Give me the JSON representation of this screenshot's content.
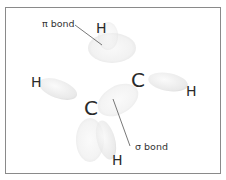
{
  "diagram": {
    "atoms": [
      {
        "id": "h-top",
        "symbol": "H"
      },
      {
        "id": "h-left",
        "symbol": "H"
      },
      {
        "id": "c-right",
        "symbol": "C"
      },
      {
        "id": "h-right",
        "symbol": "H"
      },
      {
        "id": "c-left",
        "symbol": "C"
      },
      {
        "id": "h-bottom",
        "symbol": "H"
      }
    ],
    "labels": {
      "pi_bond": "π bond",
      "sigma_bond": "σ bond"
    },
    "colors": {
      "frame": "#8a8a8a",
      "orbital": "#d9d9d9",
      "leader_line": "#555555",
      "text": "#2a2a2a"
    }
  }
}
